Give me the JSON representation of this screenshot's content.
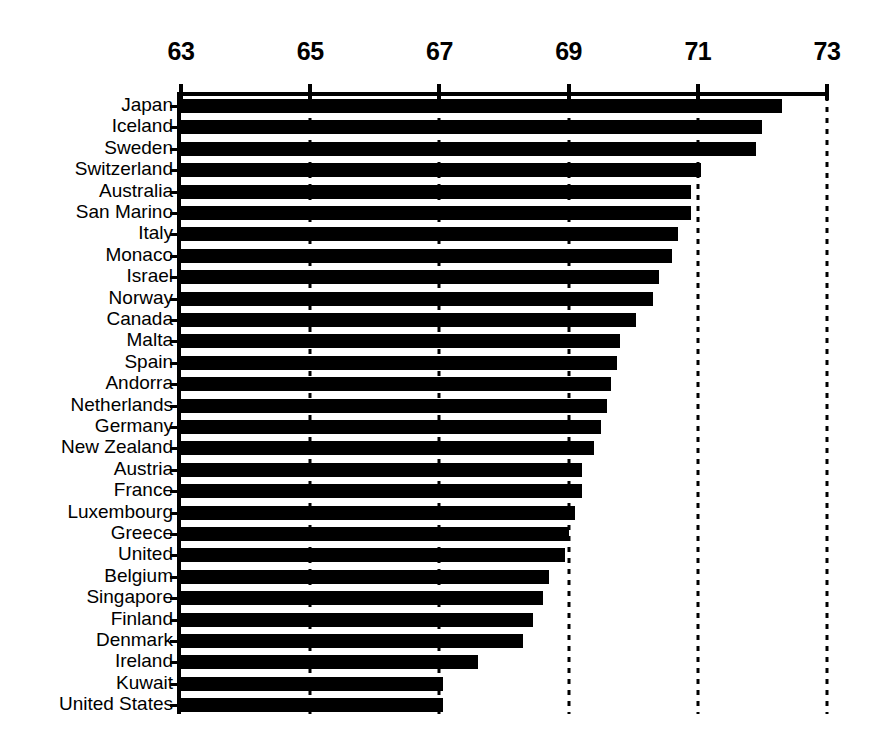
{
  "chart_data": {
    "type": "bar",
    "orientation": "horizontal",
    "title": "",
    "subtitle": "",
    "xlabel": "",
    "ylabel": "",
    "xlim": [
      63,
      73
    ],
    "xticks": [
      63,
      65,
      67,
      69,
      71,
      73
    ],
    "xtick_labels": [
      "63",
      "65",
      "67",
      "69",
      "71",
      "73"
    ],
    "grid": "vertical-dashed",
    "axis_position": "top",
    "legend": "none",
    "bar_color": "#000000",
    "background_color": "#ffffff",
    "categories": [
      "Japan",
      "Iceland",
      "Sweden",
      "Switzerland",
      "Australia",
      "San Marino",
      "Italy",
      "Monaco",
      "Israel",
      "Norway",
      "Canada",
      "Malta",
      "Spain",
      "Andorra",
      "Netherlands",
      "Germany",
      "New Zealand",
      "Austria",
      "France",
      "Luxembourg",
      "Greece",
      "United",
      "Belgium",
      "Singapore",
      "Finland",
      "Denmark",
      "Ireland",
      "Kuwait",
      "United States"
    ],
    "values": [
      72.3,
      72.0,
      71.9,
      71.05,
      70.9,
      70.9,
      70.7,
      70.6,
      70.4,
      70.3,
      70.05,
      69.8,
      69.75,
      69.65,
      69.6,
      69.5,
      69.4,
      69.2,
      69.2,
      69.1,
      69.0,
      68.95,
      68.7,
      68.6,
      68.45,
      68.3,
      67.6,
      67.05,
      67.05
    ]
  }
}
